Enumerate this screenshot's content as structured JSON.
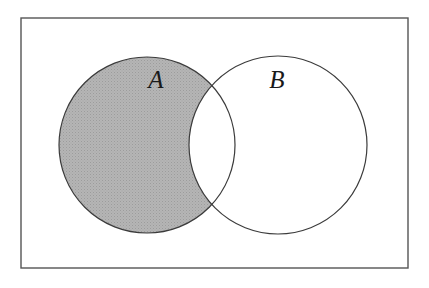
{
  "figure": {
    "kind": "venn-diagram",
    "title": "",
    "caption": "",
    "universe_label": ""
  },
  "canvas": {
    "width": 429,
    "height": 288,
    "background_color": "#ffffff"
  },
  "universe_rect": {
    "x": 21,
    "y": 18,
    "width": 387,
    "height": 250,
    "stroke_color": "#555555",
    "stroke_width": 1.4,
    "fill_color": "#ffffff"
  },
  "sets": [
    {
      "id": "A",
      "label": "A",
      "cx": 147,
      "cy": 145,
      "r": 88,
      "stroke_color": "#3b3b3b",
      "stroke_width": 1.2,
      "fill_color": "#b3b3b3",
      "filled": true,
      "label_x": 156,
      "label_y": 82
    },
    {
      "id": "B",
      "label": "B",
      "cx": 278,
      "cy": 145,
      "r": 89,
      "stroke_color": "#3b3b3b",
      "stroke_width": 1.2,
      "fill_color": "#ffffff",
      "filled": false,
      "label_x": 277,
      "label_y": 82
    }
  ],
  "shaded_region": {
    "expression": "A \\ B",
    "name": "A-minus-B",
    "fill_color": "#b3b3b3",
    "pattern": "stipple",
    "pattern_dot_color": "#9a9a9a"
  },
  "intersection_points": [
    {
      "x": 215,
      "y": 82
    },
    {
      "x": 215,
      "y": 212
    }
  ],
  "colors": {
    "shade": "#b3b3b3",
    "outline": "#3b3b3b",
    "frame": "#555555",
    "label": "#1a1a1a",
    "background": "#ffffff"
  }
}
